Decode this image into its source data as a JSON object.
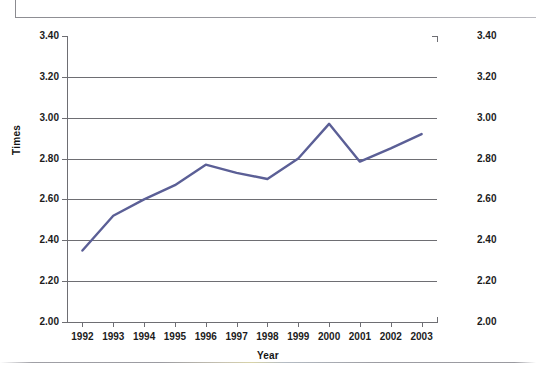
{
  "page": {
    "background_color": "#ffffff",
    "top_rule_color": "#9a9aa0",
    "bottom_rule_color": "#9b9ba1"
  },
  "chart_data": {
    "type": "line",
    "title": "",
    "subtitle": "",
    "xlabel": "Year",
    "ylabel": "Times",
    "x": [
      1992,
      1993,
      1994,
      1995,
      1996,
      1997,
      1998,
      1999,
      2000,
      2001,
      2002,
      2003
    ],
    "categories": [
      "1992",
      "1993",
      "1994",
      "1995",
      "1996",
      "1997",
      "1998",
      "1999",
      "2000",
      "2001",
      "2002",
      "2003"
    ],
    "values": [
      2.35,
      2.52,
      2.6,
      2.67,
      2.77,
      2.73,
      2.7,
      2.8,
      2.97,
      2.785,
      2.85,
      2.92
    ],
    "series": [
      {
        "name": "Times",
        "color": "#5b5f96",
        "values": [
          2.35,
          2.52,
          2.6,
          2.67,
          2.77,
          2.73,
          2.7,
          2.8,
          2.97,
          2.785,
          2.85,
          2.92
        ]
      }
    ],
    "ylim": [
      2.0,
      3.4
    ],
    "ytick_step": 0.2,
    "ytick_labels": [
      "3.40",
      "3.20",
      "3.00",
      "2.80",
      "2.60",
      "2.40",
      "2.20",
      "2.00"
    ],
    "ytick_values": [
      3.4,
      3.2,
      3.0,
      2.8,
      2.6,
      2.4,
      2.2,
      2.0
    ],
    "ytick_labels_right": [
      "3.40",
      "3.20",
      "3.00",
      "2.80",
      "2.60",
      "2.40",
      "2.20",
      "2.00"
    ],
    "dual_y_axis": true,
    "grid": "horizontal",
    "gridline_color": "#6e6e73",
    "legend": "none",
    "legend_position": "none",
    "line_width": 2.4,
    "markers": "none",
    "annotations": []
  },
  "axis_titles": {
    "y": "Times",
    "x": "Year"
  }
}
